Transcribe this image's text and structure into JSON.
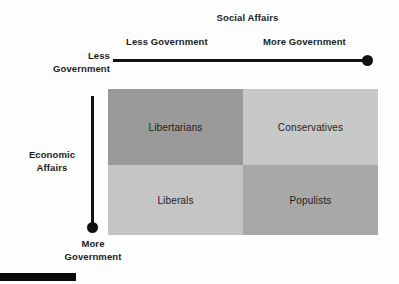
{
  "figure": {
    "title_x_axis": "Social Affairs",
    "title_y_axis_line1": "Economic",
    "title_y_axis_line2": "Affairs",
    "x_axis_left_label": "Less Government",
    "x_axis_right_label": "More Government",
    "y_axis_top_label_line1": "Less",
    "y_axis_top_label_line2": "Government",
    "y_axis_bottom_label_line1": "More",
    "y_axis_bottom_label_line2": "Government"
  },
  "chart_data": {
    "type": "heatmap",
    "title": "Social Affairs",
    "xlabel": "Social Affairs",
    "ylabel": "Economic Affairs",
    "x_categories": [
      "Less Government",
      "More Government"
    ],
    "y_categories": [
      "Less Government",
      "More Government"
    ],
    "grid": false,
    "legend_position": "none",
    "cells": [
      {
        "label": "Libertarians",
        "economic_affairs": "Less Government",
        "social_affairs": "Less Government",
        "row": 0,
        "col": 0,
        "color": "#9a9a9a"
      },
      {
        "label": "Conservatives",
        "economic_affairs": "Less Government",
        "social_affairs": "More Government",
        "row": 0,
        "col": 1,
        "color": "#c8c8c8"
      },
      {
        "label": "Liberals",
        "economic_affairs": "More Government",
        "social_affairs": "Less Government",
        "row": 1,
        "col": 0,
        "color": "#c5c5c5"
      },
      {
        "label": "Populists",
        "economic_affairs": "More Government",
        "social_affairs": "More Government",
        "row": 1,
        "col": 1,
        "color": "#a8a8a8"
      }
    ],
    "colors": {
      "quadrant_libertarians": "#9a9a9a",
      "quadrant_conservatives": "#c8c8c8",
      "quadrant_liberals": "#c5c5c5",
      "quadrant_populists": "#a8a8a8",
      "axis": "#111111",
      "text": "#1c1c1c",
      "background": "#fdfdfd"
    }
  }
}
